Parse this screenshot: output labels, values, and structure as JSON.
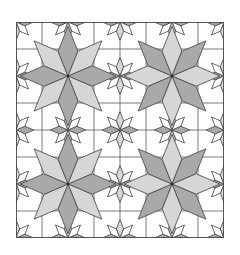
{
  "diagram": {
    "type": "quilt-pattern",
    "layout": {
      "blocks_x": 2,
      "blocks_y": 2,
      "grid_divisions_per_block": 4
    },
    "colors": {
      "background": "#ffffff",
      "dark_patch": "#a9a9a9",
      "light_patch": "#d6d6d6",
      "outline": "#4a4a4a"
    },
    "elements": [
      {
        "name": "large-eight-point-star",
        "count": 4
      },
      {
        "name": "mini-star-corner-unit",
        "count": 16
      }
    ]
  }
}
